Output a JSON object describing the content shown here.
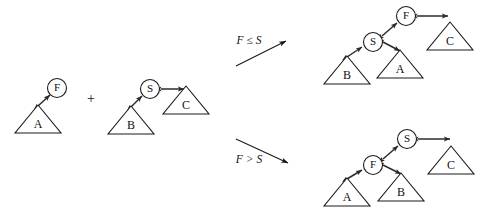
{
  "figure": {
    "colors": {
      "stroke": "#1a1a1a",
      "edge": "#2b2b2b",
      "background": "#ffffff"
    },
    "operator": "+",
    "conditions": {
      "upper": "F ≤ S",
      "lower": "F > S"
    },
    "inputs": {
      "left_tree": {
        "root_label": "F",
        "subtree_label": "A"
      },
      "right_tree": {
        "root_label": "S",
        "left_subtree_label": "B",
        "right_subtree_label": "C"
      }
    },
    "outputs": {
      "upper_result": {
        "top_node_label": "F",
        "middle_node_label": "S",
        "left_subtree_label": "B",
        "middle_subtree_label": "A",
        "right_subtree_label": "C"
      },
      "lower_result": {
        "top_node_label": "S",
        "middle_node_label": "F",
        "left_subtree_label": "A",
        "middle_subtree_label": "B",
        "right_subtree_label": "C"
      }
    }
  }
}
